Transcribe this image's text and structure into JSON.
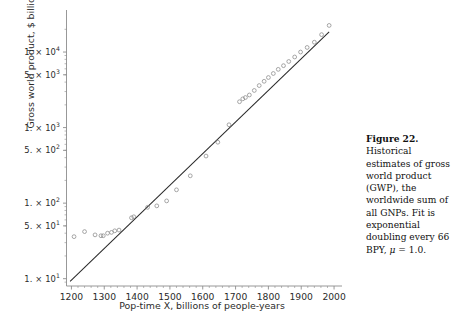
{
  "figure": {
    "caption_label": "Figure 22.",
    "caption_body": "Historical estimates of gross world product (GWP), the worldwide sum of all GNPs. Fit is exponential doubling every 66 BPY,",
    "caption_tail_mu": "μ",
    "caption_tail_rest": " = 1.0."
  },
  "chart_data": {
    "type": "scatter",
    "title": "",
    "xlabel": "Pop-time X, billions of people-years",
    "ylabel": "Gross world product, $ billions",
    "xlim": [
      1185,
      2012
    ],
    "ylim_log": [
      8.0,
      30000
    ],
    "yscale": "log",
    "grid": false,
    "legend": "none",
    "xticks": [
      1200,
      1300,
      1400,
      1500,
      1600,
      1700,
      1800,
      1900,
      2000
    ],
    "xtick_labels": [
      "1200",
      "1300",
      "1400",
      "1500",
      "1600",
      "1700",
      "1800",
      "1900",
      "2000"
    ],
    "yticks": [
      10,
      50,
      100,
      500,
      1000,
      5000,
      10000
    ],
    "ytick_labels": [
      {
        "mantissa": "1.",
        "times": "×",
        "base": "10",
        "exp": "1"
      },
      {
        "mantissa": "5.",
        "times": "×",
        "base": "10",
        "exp": "1"
      },
      {
        "mantissa": "1.",
        "times": "×",
        "base": "10",
        "exp": "2"
      },
      {
        "mantissa": "5.",
        "times": "×",
        "base": "10",
        "exp": "2"
      },
      {
        "mantissa": "1.",
        "times": "×",
        "base": "10",
        "exp": "3"
      },
      {
        "mantissa": "5.",
        "times": "×",
        "base": "10",
        "exp": "3"
      },
      {
        "mantissa": "1.",
        "times": "×",
        "base": "10",
        "exp": "4"
      }
    ],
    "marker": "open-circle",
    "marker_color": "#8a8a8a",
    "line_color": "#2a2a2a",
    "axis_color": "#8c8c8c",
    "series": [
      {
        "name": "Historical GWP estimates",
        "x": [
          1208,
          1240,
          1272,
          1290,
          1297,
          1310,
          1322,
          1332,
          1345,
          1383,
          1390,
          1432,
          1460,
          1490,
          1520,
          1562,
          1610,
          1646,
          1680,
          1712,
          1722,
          1730,
          1742,
          1757,
          1772,
          1787,
          1800,
          1815,
          1830,
          1846,
          1862,
          1880,
          1898,
          1918,
          1940,
          1962,
          1985
        ],
        "y": [
          36,
          42,
          38,
          37,
          37,
          40,
          41,
          43,
          44,
          64,
          66,
          88,
          92,
          107,
          150,
          230,
          420,
          640,
          1090,
          2200,
          2400,
          2500,
          2700,
          3100,
          3600,
          4100,
          4600,
          5200,
          5900,
          6600,
          7500,
          8600,
          10000,
          11500,
          13500,
          17000,
          22500
        ]
      }
    ],
    "fit": {
      "name": "Exponential fit, doubling every 66 BPY",
      "x0": 1196,
      "y0": 9.2,
      "x1": 1985,
      "y1": 18500,
      "doubling_bpy": 66,
      "mu": 1.0
    }
  }
}
